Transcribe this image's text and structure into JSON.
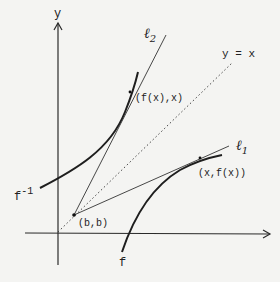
{
  "diagram": {
    "type": "function-inverse-tangent-lines",
    "colors": {
      "ink": "#222222",
      "background": "#f4f4f2"
    },
    "axes": {
      "y_label": "y",
      "x_label": ""
    },
    "reference_line": {
      "label": "y = x",
      "style": "dotted"
    },
    "curves": [
      {
        "id": "f",
        "label": "f"
      },
      {
        "id": "f_inverse",
        "label": "f",
        "superscript": "-1"
      }
    ],
    "lines": [
      {
        "id": "l1",
        "label": "ℓ",
        "subscript": "1"
      },
      {
        "id": "l2",
        "label": "ℓ",
        "subscript": "2"
      }
    ],
    "points": [
      {
        "id": "b",
        "label": "(b,b)"
      },
      {
        "id": "fx_x",
        "label": "(f(x),x)"
      },
      {
        "id": "x_fx",
        "label": "(x,f(x))"
      }
    ]
  }
}
